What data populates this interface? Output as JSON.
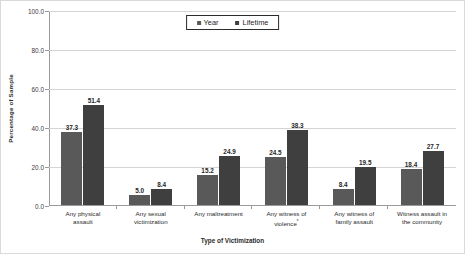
{
  "chart_data": {
    "type": "bar",
    "title": "",
    "xlabel": "Type of Victimization",
    "ylabel": "Percentage of Sample",
    "ylim": [
      0,
      100
    ],
    "yticks": [
      "0.0",
      "20.0",
      "40.0",
      "60.0",
      "80.0",
      "100.0"
    ],
    "ytick_values": [
      0,
      20,
      40,
      60,
      80,
      100
    ],
    "grid": "horizontal",
    "legend_position": "top-center",
    "categories": [
      "Any physical assault",
      "Any sexual victimization",
      "Any maltreatment",
      "Any witness of violence*",
      "Any witness of family assault",
      "Witness assault in the community"
    ],
    "category_lines": [
      [
        "Any physical",
        "assault"
      ],
      [
        "Any sexual",
        "victimization"
      ],
      [
        "Any maltreatment"
      ],
      [
        "Any witness of",
        "violence*"
      ],
      [
        "Any witness of",
        "family assault"
      ],
      [
        "Witness assault in",
        "the community"
      ]
    ],
    "series": [
      {
        "name": "Year",
        "color": "#595959",
        "values": [
          37.3,
          5.0,
          15.2,
          24.5,
          8.4,
          18.4
        ],
        "labels": [
          "37.3",
          "5.0",
          "15.2",
          "24.5",
          "8.4",
          "18.4"
        ]
      },
      {
        "name": "Lifetime",
        "color": "#3f3f3f",
        "values": [
          51.4,
          8.4,
          24.9,
          38.3,
          19.5,
          27.7
        ],
        "labels": [
          "51.4",
          "8.4",
          "24.9",
          "38.3",
          "19.5",
          "27.7"
        ]
      }
    ]
  },
  "legend": {
    "items": [
      {
        "label": "Year",
        "color": "#595959"
      },
      {
        "label": "Lifetime",
        "color": "#3f3f3f"
      }
    ]
  }
}
